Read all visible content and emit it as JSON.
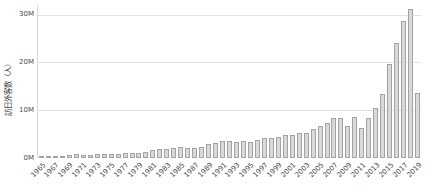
{
  "chart": {
    "y_axis_title": "訪日外客数（人）",
    "x_axis_title": ""
  },
  "chart_data": {
    "type": "bar",
    "title": "",
    "xlabel": "",
    "ylabel": "訪日外客数（人）",
    "unit": "millions of persons",
    "ylim": [
      0,
      32
    ],
    "grid": true,
    "legend": false,
    "y_tick_labels": [
      "0M",
      "10M",
      "20M",
      "30M"
    ],
    "y_gridline_values": [
      10,
      20,
      30
    ],
    "x_tick_labels": [
      "1965",
      "1967",
      "1969",
      "1971",
      "1973",
      "1975",
      "1977",
      "1979",
      "1981",
      "1983",
      "1985",
      "1987",
      "1989",
      "1991",
      "1993",
      "1995",
      "1997",
      "1999",
      "2001",
      "2003",
      "2005",
      "2007",
      "2009",
      "2011",
      "2013",
      "2015",
      "2017",
      "2019"
    ],
    "categories": [
      1965,
      1966,
      1967,
      1968,
      1969,
      1970,
      1971,
      1972,
      1973,
      1974,
      1975,
      1976,
      1977,
      1978,
      1979,
      1980,
      1981,
      1982,
      1983,
      1984,
      1985,
      1986,
      1987,
      1988,
      1989,
      1990,
      1991,
      1992,
      1993,
      1994,
      1995,
      1996,
      1997,
      1998,
      1999,
      2000,
      2001,
      2002,
      2003,
      2004,
      2005,
      2006,
      2007,
      2008,
      2009,
      2010,
      2011,
      2012,
      2013,
      2014,
      2015,
      2016,
      2017,
      2018,
      2019
    ],
    "values": [
      0.37,
      0.43,
      0.48,
      0.52,
      0.61,
      0.85,
      0.66,
      0.72,
      0.78,
      0.76,
      0.81,
      0.91,
      1.03,
      1.04,
      1.11,
      1.32,
      1.58,
      1.79,
      1.97,
      2.11,
      2.33,
      2.06,
      2.15,
      2.35,
      2.84,
      3.24,
      3.53,
      3.58,
      3.41,
      3.47,
      3.34,
      3.84,
      4.22,
      4.11,
      4.44,
      4.76,
      4.77,
      5.24,
      5.21,
      6.14,
      6.73,
      7.33,
      8.35,
      8.35,
      6.79,
      8.61,
      6.22,
      8.36,
      10.36,
      13.41,
      19.74,
      24.04,
      28.69,
      31.19,
      13.7
    ],
    "colors": {
      "background": "#ffffff",
      "bar_fill": "#d9d9d9",
      "bar_border": "#a3a3a3",
      "gridline": "#e2e2e2",
      "axis_line": "#d6d6d6",
      "tick_label": "#4a4a4a",
      "axis_title": "#3c3c3c"
    }
  }
}
